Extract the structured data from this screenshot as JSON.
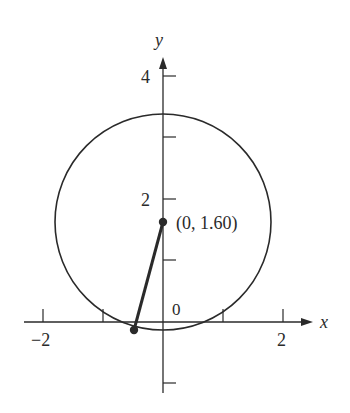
{
  "diagram": {
    "type": "circle-on-axes",
    "axes": {
      "x_label": "x",
      "y_label": "y",
      "x_ticks": [
        {
          "value": -2,
          "label": "−2"
        },
        {
          "value": -1,
          "label": ""
        },
        {
          "value": 1,
          "label": ""
        },
        {
          "value": 2,
          "label": "2"
        }
      ],
      "y_ticks": [
        {
          "value": -1,
          "label": ""
        },
        {
          "value": 1,
          "label": ""
        },
        {
          "value": 2,
          "label": "2"
        },
        {
          "value": 3,
          "label": ""
        },
        {
          "value": 4,
          "label": "4"
        }
      ],
      "origin_label": "0"
    },
    "circle": {
      "center": [
        0,
        1.6
      ],
      "radius": 1.8
    },
    "center_point": {
      "coords": [
        0,
        1.6
      ],
      "label": "(0, 1.60)"
    },
    "rim_point": {
      "coords": [
        -0.48,
        -0.13
      ]
    },
    "radius_segment": {
      "from": "center_point",
      "to": "rim_point"
    },
    "colors": {
      "stroke": "#2a2a2a",
      "background": "#ffffff"
    }
  }
}
